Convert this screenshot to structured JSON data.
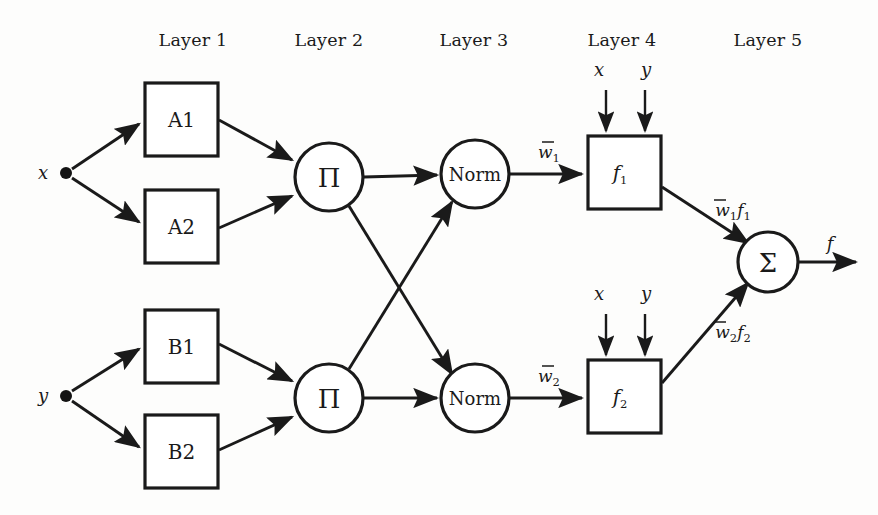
{
  "figure": {
    "background_color": "#fdfdfc",
    "ink_color": "#1a1a1a"
  },
  "layer_headers": [
    {
      "label": "Layer 1",
      "x": 193
    },
    {
      "label": "Layer 2",
      "x": 329
    },
    {
      "label": "Layer 3",
      "x": 474
    },
    {
      "label": "Layer 4",
      "x": 622
    },
    {
      "label": "Layer 5",
      "x": 768
    }
  ],
  "inputs": [
    {
      "name": "x",
      "label": "x",
      "dot_x": 66,
      "dot_y": 173,
      "label_x": 43,
      "label_y": 179
    },
    {
      "name": "y",
      "label": "y",
      "dot_x": 66,
      "dot_y": 396,
      "label_x": 43,
      "label_y": 402
    }
  ],
  "membership_nodes": [
    {
      "id": "A1",
      "label": "A1",
      "x": 145,
      "y": 83,
      "w": 73,
      "h": 73
    },
    {
      "id": "A2",
      "label": "A2",
      "x": 145,
      "y": 190,
      "w": 73,
      "h": 73
    },
    {
      "id": "B1",
      "label": "B1",
      "x": 145,
      "y": 310,
      "w": 73,
      "h": 73
    },
    {
      "id": "B2",
      "label": "B2",
      "x": 145,
      "y": 415,
      "w": 73,
      "h": 73
    }
  ],
  "product_nodes": [
    {
      "id": "prod1",
      "label": "Π",
      "cx": 329,
      "cy": 177,
      "r": 34
    },
    {
      "id": "prod2",
      "label": "Π",
      "cx": 329,
      "cy": 398,
      "r": 34
    }
  ],
  "norm_nodes": [
    {
      "id": "norm1",
      "label": "Norm",
      "cx": 475,
      "cy": 174,
      "r": 34
    },
    {
      "id": "norm2",
      "label": "Norm",
      "cx": 475,
      "cy": 398,
      "r": 34
    }
  ],
  "consequent_nodes": [
    {
      "id": "f1",
      "label": "f",
      "subscript": "1",
      "x": 588,
      "y": 136,
      "w": 73,
      "h": 73,
      "top_inputs": [
        {
          "label": "x",
          "label_x": 599,
          "label_y": 76,
          "arrow_x": 606
        },
        {
          "label": "y",
          "label_x": 646,
          "label_y": 76,
          "arrow_x": 645
        }
      ]
    },
    {
      "id": "f2",
      "label": "f",
      "subscript": "2",
      "x": 588,
      "y": 360,
      "w": 73,
      "h": 73,
      "top_inputs": [
        {
          "label": "x",
          "label_x": 599,
          "label_y": 300,
          "arrow_x": 606
        },
        {
          "label": "y",
          "label_x": 646,
          "label_y": 300,
          "arrow_x": 645
        }
      ]
    }
  ],
  "sum_node": {
    "id": "sum",
    "label": "Σ",
    "cx": 768,
    "cy": 262,
    "r": 30
  },
  "output": {
    "label": "f",
    "label_x": 830,
    "label_y": 250
  },
  "weight_labels": [
    {
      "id": "w1",
      "base": "w",
      "subscript": "1",
      "x": 549,
      "y": 152,
      "overbar": true
    },
    {
      "id": "w2",
      "base": "w",
      "subscript": "2",
      "x": 549,
      "y": 376,
      "overbar": true
    }
  ],
  "product_labels": [
    {
      "id": "w1f1",
      "base": "w",
      "subscript": "1",
      "base2": "f",
      "subscript2": "1",
      "x": 733,
      "y": 210,
      "overbar": true
    },
    {
      "id": "w2f2",
      "base": "w",
      "subscript": "2",
      "base2": "f",
      "subscript2": "2",
      "x": 733,
      "y": 332,
      "overbar": true
    }
  ]
}
